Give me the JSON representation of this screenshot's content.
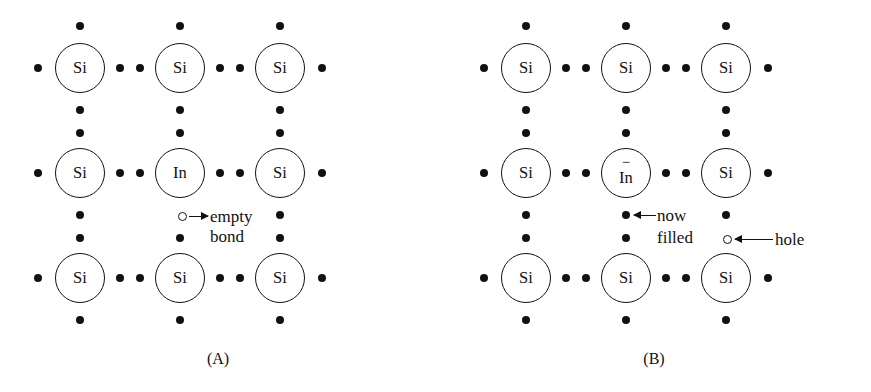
{
  "figure": {
    "ink_color": "#111111",
    "background": "#ffffff"
  },
  "panels": [
    {
      "id": "A",
      "caption": "(A)",
      "atoms": [
        {
          "symbol": "Si",
          "charge": "",
          "row": 0,
          "col": 0
        },
        {
          "symbol": "Si",
          "charge": "",
          "row": 0,
          "col": 1
        },
        {
          "symbol": "Si",
          "charge": "",
          "row": 0,
          "col": 2
        },
        {
          "symbol": "Si",
          "charge": "",
          "row": 1,
          "col": 0
        },
        {
          "symbol": "In",
          "charge": "",
          "row": 1,
          "col": 1
        },
        {
          "symbol": "Si",
          "charge": "",
          "row": 1,
          "col": 2
        },
        {
          "symbol": "Si",
          "charge": "",
          "row": 2,
          "col": 0
        },
        {
          "symbol": "Si",
          "charge": "",
          "row": 2,
          "col": 1
        },
        {
          "symbol": "Si",
          "charge": "",
          "row": 2,
          "col": 2
        }
      ],
      "annotations": [
        {
          "name": "empty-bond",
          "marker": "open-circle",
          "arrow_direction": "right",
          "text_line1": "empty",
          "text_line2": "bond"
        }
      ]
    },
    {
      "id": "B",
      "caption": "(B)",
      "atoms": [
        {
          "symbol": "Si",
          "charge": "",
          "row": 0,
          "col": 0
        },
        {
          "symbol": "Si",
          "charge": "",
          "row": 0,
          "col": 1
        },
        {
          "symbol": "Si",
          "charge": "",
          "row": 0,
          "col": 2
        },
        {
          "symbol": "Si",
          "charge": "",
          "row": 1,
          "col": 0
        },
        {
          "symbol": "In",
          "charge": "−",
          "row": 1,
          "col": 1
        },
        {
          "symbol": "Si",
          "charge": "",
          "row": 1,
          "col": 2
        },
        {
          "symbol": "Si",
          "charge": "",
          "row": 2,
          "col": 0
        },
        {
          "symbol": "Si",
          "charge": "",
          "row": 2,
          "col": 1
        },
        {
          "symbol": "Si",
          "charge": "",
          "row": 2,
          "col": 2
        }
      ],
      "annotations": [
        {
          "name": "now-filled",
          "marker": "filled-dot",
          "arrow_direction": "left",
          "text_line1": "now",
          "text_line2": "filled"
        },
        {
          "name": "hole",
          "marker": "open-circle",
          "arrow_direction": "left",
          "text_line1": "hole",
          "text_line2": ""
        }
      ]
    }
  ]
}
